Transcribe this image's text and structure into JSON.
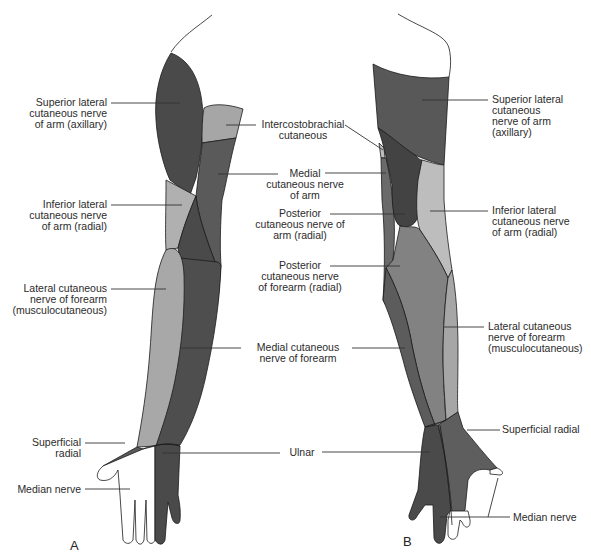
{
  "figure": {
    "panels": [
      {
        "letter": "A",
        "view": "anterior arm"
      },
      {
        "letter": "B",
        "view": "posterior arm"
      }
    ],
    "colors": {
      "dark": "#4a4a4a",
      "medium_dark": "#585858",
      "medium": "#6a6a6a",
      "light": "#a6a6a6",
      "lighter": "#bdbdbd",
      "skin": "#ffffff",
      "outline": "#1a1a1a",
      "leader": "#333333"
    }
  },
  "labels": {
    "a_superior_lateral": "Superior lateral\ncutaneous nerve\nof arm (axillary)",
    "a_inferior_lateral": "Inferior lateral\ncutaneous nerve\nof arm (radial)",
    "a_lateral_forearm": "Lateral cutaneous\nnerve of forearm\n(musculocutaneous)",
    "a_superficial_radial": "Superficial\nradial",
    "a_median": "Median nerve",
    "intercostobrachial": "Intercostobrachial\ncutaneous",
    "medial_arm": "Medial\ncutaneous nerve\nof arm",
    "posterior_arm": "Posterior\ncutaneous nerve of\narm (radial)",
    "posterior_forearm": "Posterior\ncutaneous nerve\nof forearm (radial)",
    "medial_forearm": "Medial cutaneous\nnerve of forearm",
    "ulnar": "Ulnar",
    "b_superior_lateral": "Superior lateral\ncutaneous\nnerve of arm\n(axillary)",
    "b_inferior_lateral": "Inferior lateral\ncutaneous nerve\nof arm (radial)",
    "b_lateral_forearm": "Lateral cutaneous\nnerve of forearm\n(musculocutaneous)",
    "b_superficial_radial": "Superficial radial",
    "b_median": "Median nerve"
  }
}
